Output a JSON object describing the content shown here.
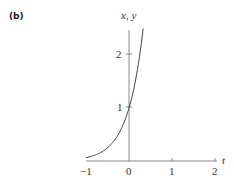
{
  "panel_label": "(b)",
  "chart_data": {
    "type": "line",
    "title": "",
    "xlabel": "t",
    "ylabel": "x, y",
    "x_ticks": [
      "−1",
      "0",
      "1",
      "2"
    ],
    "y_ticks": [
      "1",
      "2"
    ],
    "xlim": [
      -1,
      2
    ],
    "ylim": [
      0,
      2.5
    ],
    "grid": false,
    "series": [
      {
        "name": "exponential curve",
        "x": [
          -1,
          -0.75,
          -0.5,
          -0.25,
          0,
          0.1,
          0.2,
          0.33
        ],
        "y": [
          0.06,
          0.12,
          0.25,
          0.5,
          1.0,
          1.32,
          1.75,
          2.5
        ]
      }
    ],
    "colors": {
      "axis": "#888888",
      "curve": "#444444",
      "text": "#333333"
    }
  }
}
